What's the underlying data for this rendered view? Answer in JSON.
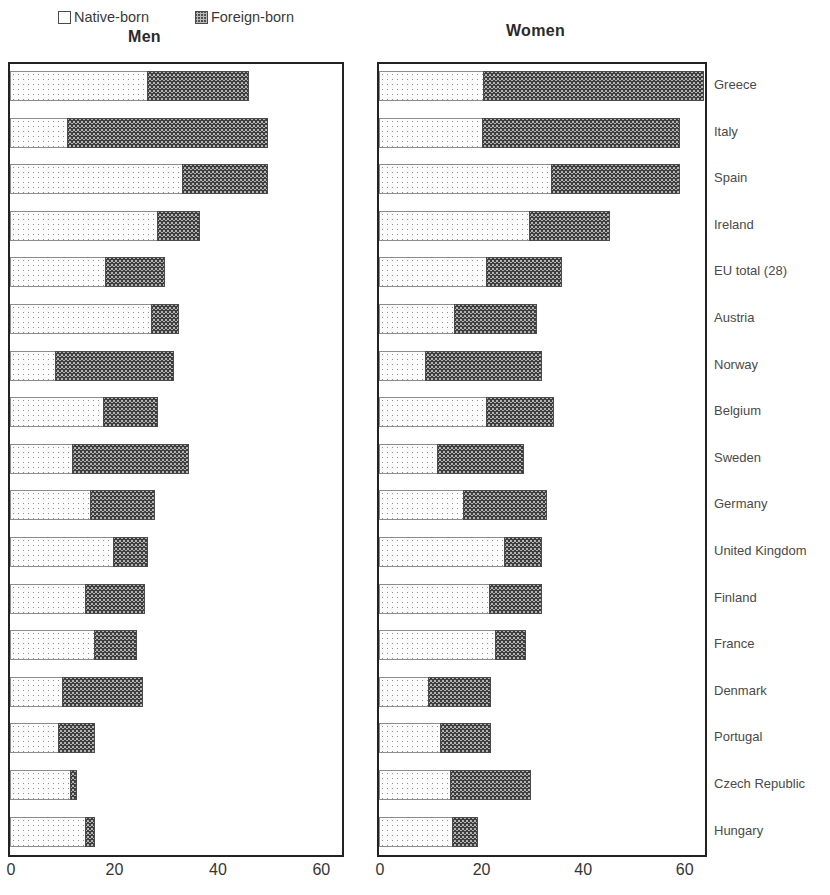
{
  "legend": {
    "items": [
      {
        "label": "Native-born",
        "swatch": "native-born-swatch"
      },
      {
        "label": "Foreign-born",
        "swatch": "foreign-born-swatch"
      }
    ]
  },
  "panels": {
    "men_title": "Men",
    "women_title": "Women"
  },
  "axis": {
    "ticks": [
      "0",
      "20",
      "40",
      "60"
    ],
    "tick_values": [
      0,
      20,
      40,
      60
    ],
    "min": 0,
    "max": 64
  },
  "chart_data": {
    "type": "bar",
    "orientation": "horizontal",
    "stacked": true,
    "title": "",
    "subtitle": "",
    "xlabel": "",
    "ylabel": "",
    "xlim": [
      0,
      64
    ],
    "grid": false,
    "legend_position": "top-left",
    "categories": [
      "Greece",
      "Italy",
      "Spain",
      "Ireland",
      "EU total (28)",
      "Austria",
      "Norway",
      "Belgium",
      "Sweden",
      "Germany",
      "United Kingdom",
      "Finland",
      "France",
      "Denmark",
      "Portugal",
      "Czech Republic",
      "Hungary"
    ],
    "panels": [
      {
        "name": "Men",
        "series": [
          {
            "name": "Native-born",
            "values": [
              26.7,
              11.3,
              33.5,
              28.7,
              18.5,
              27.5,
              8.8,
              18.1,
              12.1,
              15.6,
              20.2,
              14.6,
              16.5,
              10.2,
              9.4,
              11.7,
              14.6
            ]
          },
          {
            "name": "Foreign-born",
            "values": [
              19.6,
              38.6,
              16.4,
              8.1,
              11.5,
              5.1,
              22.9,
              10.6,
              22.5,
              12.5,
              6.5,
              11.5,
              8.1,
              15.6,
              7.1,
              1.3,
              1.9
            ]
          }
        ],
        "totals": [
          46.3,
          49.9,
          49.9,
          36.8,
          30.0,
          32.6,
          31.7,
          28.7,
          34.6,
          28.1,
          26.7,
          26.1,
          24.6,
          25.8,
          16.5,
          13.0,
          16.5
        ]
      },
      {
        "name": "Women",
        "series": [
          {
            "name": "Native-born",
            "values": [
              20.6,
              20.4,
              34.0,
              29.7,
              21.2,
              15.0,
              9.2,
              21.2,
              11.6,
              16.8,
              24.8,
              21.8,
              23.0,
              9.8,
              12.2,
              14.2,
              14.6
            ]
          },
          {
            "name": "Foreign-born",
            "values": [
              43.4,
              38.8,
              25.2,
              15.7,
              14.8,
              16.2,
              22.8,
              13.2,
              17.0,
              16.2,
              7.2,
              10.2,
              6.0,
              12.2,
              9.8,
              15.8,
              4.8
            ]
          }
        ],
        "totals": [
          64.0,
          59.2,
          59.2,
          45.4,
          36.0,
          31.2,
          32.0,
          34.4,
          28.6,
          33.0,
          32.0,
          32.0,
          29.0,
          22.0,
          22.0,
          30.0,
          19.4
        ]
      }
    ]
  }
}
